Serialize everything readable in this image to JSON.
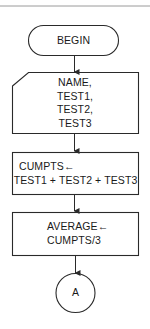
{
  "flowchart": {
    "nodes": [
      {
        "id": "begin",
        "type": "terminator",
        "lines": [
          "BEGIN"
        ]
      },
      {
        "id": "input",
        "type": "manual-input",
        "lines": [
          "NAME,",
          "TEST1,",
          "TEST2,",
          "TEST3"
        ]
      },
      {
        "id": "sum",
        "type": "process",
        "lines": [
          "CUMPTS←",
          "TEST1 + TEST2 + TEST3"
        ]
      },
      {
        "id": "avg",
        "type": "process",
        "lines": [
          "AVERAGE←",
          "CUMPTS/3"
        ]
      },
      {
        "id": "conn",
        "type": "connector",
        "lines": [
          "A"
        ]
      }
    ],
    "edges": [
      {
        "from": "begin",
        "to": "input"
      },
      {
        "from": "input",
        "to": "sum"
      },
      {
        "from": "sum",
        "to": "avg"
      },
      {
        "from": "avg",
        "to": "conn"
      }
    ],
    "colors": {
      "stroke": "#2a2a2a",
      "text": "#1a1a1a",
      "rule": "#9a9a9a"
    }
  }
}
